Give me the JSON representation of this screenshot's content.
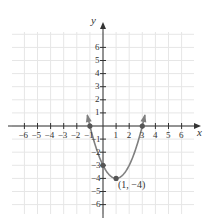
{
  "chart_data": {
    "type": "line",
    "title": "",
    "xlabel": "x",
    "ylabel": "y",
    "xlim": [
      -6.5,
      7
    ],
    "ylim": [
      -6.5,
      7
    ],
    "grid": true,
    "x_ticks": [
      -6,
      -5,
      -4,
      -3,
      -2,
      -1,
      1,
      2,
      3,
      4,
      5,
      6
    ],
    "y_ticks": [
      6,
      5,
      4,
      3,
      2,
      1,
      -1,
      -2,
      -3,
      -4,
      -5,
      -6
    ],
    "x_tick_labels": [
      "−6",
      "−5",
      "−4",
      "−3",
      "−2",
      "−1",
      "1",
      "2",
      "3",
      "4",
      "5",
      "6"
    ],
    "y_tick_labels": [
      "6",
      "5",
      "4",
      "3",
      "2",
      "1",
      "−1",
      "−2",
      "−3",
      "−4",
      "−5",
      "−6"
    ],
    "series": [
      {
        "name": "y = x^2 - 2x - 3",
        "equation": "y = (x - 1)^2 - 4",
        "x": [
          -1.25,
          -1,
          0,
          1,
          2,
          3,
          3.25
        ],
        "y": [
          7.06,
          0,
          -3,
          -4,
          -3,
          0,
          7.06
        ],
        "color": "#777777"
      }
    ],
    "marked_points": [
      {
        "x": -1,
        "y": 0,
        "label": ""
      },
      {
        "x": 0,
        "y": -3,
        "label": ""
      },
      {
        "x": 1,
        "y": -4,
        "label": "(1, −4)"
      },
      {
        "x": 3,
        "y": 0,
        "label": ""
      }
    ]
  },
  "labels": {
    "x_axis": "x",
    "y_axis": "y",
    "vertex": "(1, −4)"
  },
  "colors": {
    "curve": "#808080",
    "axis": "#333333",
    "grid": "#e6e6e6",
    "point": "#555555"
  }
}
